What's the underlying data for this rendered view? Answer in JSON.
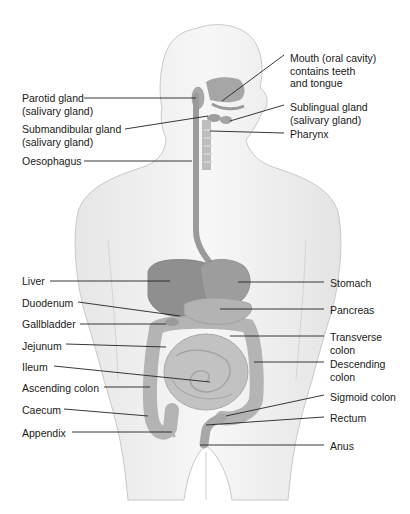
{
  "colors": {
    "body_fill": "#f1f1f1",
    "body_stroke": "#c8c8c8",
    "organ_dark": "#8e8e8e",
    "organ_mid": "#a9a9a9",
    "organ_light": "#c4c4c4",
    "leader_line": "#222222"
  },
  "labels_left": [
    {
      "id": "parotid",
      "text": "Parotid gland\n(salivary gland)",
      "x": 22,
      "y": 92,
      "line": [
        [
          84,
          98
        ],
        [
          196,
          98
        ]
      ]
    },
    {
      "id": "submandibular",
      "text": "Submandibular gland\n(salivary gland)",
      "x": 22,
      "y": 123,
      "line": [
        [
          125,
          129
        ],
        [
          208,
          116
        ]
      ]
    },
    {
      "id": "oesophagus",
      "text": "Oesophagus",
      "x": 22,
      "y": 155,
      "line": [
        [
          84,
          161
        ],
        [
          192,
          161
        ]
      ]
    },
    {
      "id": "liver",
      "text": "Liver",
      "x": 22,
      "y": 275,
      "line": [
        [
          50,
          281
        ],
        [
          170,
          281
        ]
      ]
    },
    {
      "id": "duodenum",
      "text": "Duodenum",
      "x": 22,
      "y": 297,
      "line": [
        [
          78,
          302
        ],
        [
          180,
          316
        ]
      ]
    },
    {
      "id": "gallbladder",
      "text": "Gallbladder",
      "x": 22,
      "y": 318,
      "line": [
        [
          80,
          324
        ],
        [
          166,
          324
        ]
      ]
    },
    {
      "id": "jejunum",
      "text": "Jejunum",
      "x": 22,
      "y": 340,
      "line": [
        [
          66,
          344
        ],
        [
          166,
          347
        ]
      ]
    },
    {
      "id": "ileum",
      "text": "Ileum",
      "x": 22,
      "y": 361,
      "line": [
        [
          54,
          366
        ],
        [
          210,
          382
        ]
      ]
    },
    {
      "id": "ascending_colon",
      "text": "Ascending colon",
      "x": 22,
      "y": 382,
      "line": [
        [
          104,
          387
        ],
        [
          150,
          387
        ]
      ]
    },
    {
      "id": "caecum",
      "text": "Caecum",
      "x": 22,
      "y": 404,
      "line": [
        [
          64,
          409
        ],
        [
          148,
          416
        ]
      ]
    },
    {
      "id": "appendix",
      "text": "Appendix",
      "x": 22,
      "y": 427,
      "line": [
        [
          72,
          432
        ],
        [
          172,
          432
        ]
      ]
    }
  ],
  "labels_right": [
    {
      "id": "mouth",
      "text": "Mouth (oral cavity)\ncontains teeth\nand tongue",
      "x": 290,
      "y": 52,
      "line": [
        [
          284,
          55
        ],
        [
          222,
          101
        ]
      ]
    },
    {
      "id": "sublingual",
      "text": "Sublingual gland\n(salivary gland)",
      "x": 290,
      "y": 101,
      "line": [
        [
          284,
          105
        ],
        [
          230,
          121
        ]
      ]
    },
    {
      "id": "pharynx",
      "text": "Pharynx",
      "x": 290,
      "y": 128,
      "line": [
        [
          284,
          133
        ],
        [
          210,
          131
        ]
      ]
    },
    {
      "id": "stomach",
      "text": "Stomach",
      "x": 330,
      "y": 277,
      "line": [
        [
          324,
          282
        ],
        [
          238,
          282
        ]
      ]
    },
    {
      "id": "pancreas",
      "text": "Pancreas",
      "x": 330,
      "y": 304,
      "line": [
        [
          324,
          309
        ],
        [
          220,
          309
        ]
      ]
    },
    {
      "id": "transverse_colon",
      "text": "Transverse\ncolon",
      "x": 330,
      "y": 331,
      "line": [
        [
          324,
          336
        ],
        [
          230,
          336
        ]
      ]
    },
    {
      "id": "descending_colon",
      "text": "Descending\ncolon",
      "x": 330,
      "y": 358,
      "line": [
        [
          324,
          362
        ],
        [
          254,
          362
        ]
      ]
    },
    {
      "id": "sigmoid_colon",
      "text": "Sigmoid colon",
      "x": 330,
      "y": 391,
      "line": [
        [
          324,
          395
        ],
        [
          226,
          416
        ]
      ]
    },
    {
      "id": "rectum",
      "text": "Rectum",
      "x": 330,
      "y": 412,
      "line": [
        [
          324,
          417
        ],
        [
          206,
          425
        ]
      ]
    },
    {
      "id": "anus",
      "text": "Anus",
      "x": 330,
      "y": 440,
      "line": [
        [
          324,
          445
        ],
        [
          200,
          445
        ]
      ]
    }
  ]
}
